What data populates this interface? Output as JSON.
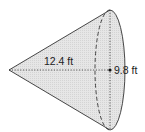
{
  "diagram": {
    "type": "cone",
    "orientation": "apex-left",
    "labels": {
      "slant_or_height": "12.4 ft",
      "radius": "9.8 ft"
    },
    "colors": {
      "fill": "#e3e3e3",
      "stroke": "#333333",
      "background": "#ffffff"
    }
  }
}
